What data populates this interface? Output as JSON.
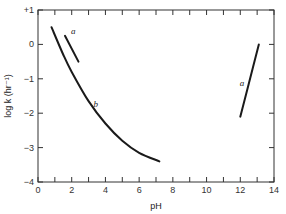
{
  "chart_data": {
    "type": "line",
    "title": "",
    "xlabel": "pH",
    "ylabel": "log k (hr⁻¹)",
    "xlim": [
      0,
      14
    ],
    "ylim": [
      -4,
      1
    ],
    "x_ticks": [
      0,
      2,
      4,
      6,
      8,
      10,
      12,
      14
    ],
    "x_tick_labels": [
      "0",
      "2",
      "4",
      "6",
      "8",
      "10",
      "12",
      "14"
    ],
    "x_minor_ticks": [
      1,
      3,
      5,
      7,
      9,
      11,
      13
    ],
    "y_ticks": [
      1,
      0,
      -1,
      -2,
      -3,
      -4
    ],
    "y_tick_labels": [
      "+1",
      "0",
      "−1",
      "−2",
      "−3",
      "−4"
    ],
    "grid": false,
    "legend": null,
    "series": [
      {
        "name": "a",
        "label": "a",
        "x": [
          1.6,
          2.4
        ],
        "y": [
          0.25,
          -0.5
        ]
      },
      {
        "name": "b",
        "label": "b",
        "x": [
          0.8,
          1.5,
          2.0,
          3.0,
          4.0,
          5.0,
          6.0,
          7.2
        ],
        "y": [
          0.5,
          -0.3,
          -0.8,
          -1.65,
          -2.3,
          -2.8,
          -3.15,
          -3.4
        ]
      },
      {
        "name": "a (alkaline)",
        "label": "a",
        "x": [
          12.0,
          12.5,
          13.1
        ],
        "y": [
          -2.1,
          -1.15,
          0.0
        ]
      }
    ]
  }
}
